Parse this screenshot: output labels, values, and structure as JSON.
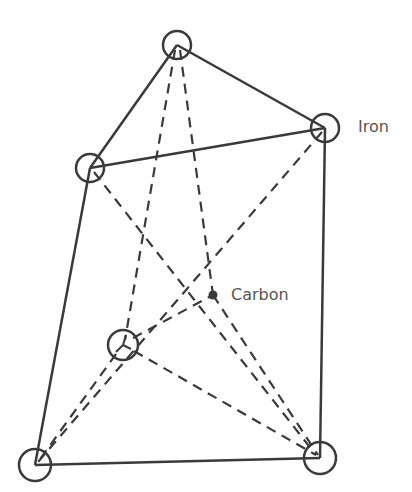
{
  "labels": {
    "iron": "Iron",
    "carbon": "Carbon"
  },
  "colors": {
    "line": "#3a3a3a",
    "label": "#555555"
  },
  "atoms": {
    "top": {
      "x": 177,
      "y": 45,
      "type": "iron"
    },
    "right_upper": {
      "x": 325,
      "y": 128,
      "type": "iron"
    },
    "left_upper": {
      "x": 90,
      "y": 168,
      "type": "iron"
    },
    "inner": {
      "x": 123,
      "y": 345,
      "type": "iron"
    },
    "bottom_right": {
      "x": 318,
      "y": 458,
      "type": "iron"
    },
    "bottom_left": {
      "x": 35,
      "y": 465,
      "type": "iron"
    },
    "carbon": {
      "x": 213,
      "y": 295,
      "type": "carbon"
    }
  },
  "solid_edges": [
    [
      "top",
      "right_upper"
    ],
    [
      "top",
      "left_upper"
    ],
    [
      "left_upper",
      "right_upper"
    ],
    [
      "left_upper",
      "bottom_left"
    ],
    [
      "right_upper",
      "bottom_right"
    ],
    [
      "bottom_left",
      "bottom_right"
    ]
  ],
  "dashed_edges": [
    [
      "top",
      "inner"
    ],
    [
      "top",
      "bottom_right"
    ],
    [
      "right_upper",
      "bottom_left"
    ],
    [
      "left_upper",
      "bottom_right"
    ],
    [
      "inner",
      "carbon"
    ],
    [
      "inner",
      "bottom_left"
    ],
    [
      "inner",
      "bottom_right"
    ],
    [
      "carbon",
      "bottom_left"
    ]
  ]
}
